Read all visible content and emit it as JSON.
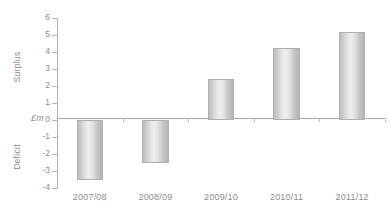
{
  "chart_data": {
    "type": "bar",
    "title": "",
    "xlabel": "",
    "ylabel": "£m",
    "categories": [
      "2007/08",
      "2008/09",
      "2009/10",
      "2010/11",
      "2011/12"
    ],
    "values": [
      -3.5,
      -2.5,
      2.4,
      4.25,
      5.15
    ],
    "series": [
      {
        "name": "Surplus/Deficit",
        "values": [
          -3.5,
          -2.5,
          2.4,
          4.25,
          5.15
        ]
      }
    ],
    "ylim": [
      -4,
      6
    ],
    "ytick_labels": [
      "6",
      "5",
      "4",
      "3",
      "2",
      "1",
      "0",
      "-1",
      "-2",
      "-3",
      "-4"
    ],
    "ytick_values": [
      6,
      5,
      4,
      3,
      2,
      1,
      0,
      -1,
      -2,
      -3,
      -4
    ],
    "grid": false,
    "legend": null,
    "axis_region_labels": {
      "positive": "Surplus",
      "negative": "Deficit",
      "unit": "£m"
    },
    "bar_color": "#d8d8d8",
    "axis_color": "#b4b4b4",
    "text_color": "#8b8b8b",
    "background": "#ffffff"
  }
}
